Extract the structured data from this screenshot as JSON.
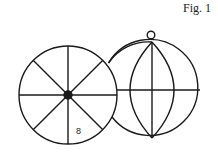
{
  "figure": {
    "label": "Fig. 1",
    "left_wheel": {
      "description": "circle with 8 spokes radiating from a solid hub",
      "spoke_count": 8,
      "segment_label": "8"
    },
    "right_globe": {
      "description": "circle with hanging ring on top, vertical and horizontal axes, and two meridian arcs"
    },
    "colors": {
      "line": "#1a1a1a",
      "background": "#ffffff"
    }
  }
}
